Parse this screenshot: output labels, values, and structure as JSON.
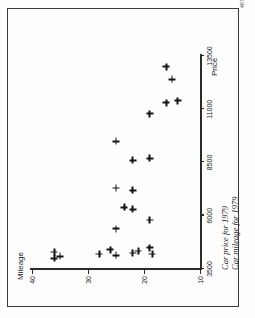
{
  "page": {
    "folio": "467",
    "background_color": "#fdfdfd",
    "ink_color": "#141414"
  },
  "caption": "Car price for 1979\nCar mileage for 1979",
  "chart_data": {
    "type": "scatter",
    "title": "",
    "xlabel": "Price",
    "ylabel": "Mileage",
    "xlim": [
      3500,
      13500
    ],
    "ylim": [
      10,
      40
    ],
    "xticks": [
      3500,
      6000,
      8500,
      11000,
      13500
    ],
    "xtick_labels": [
      "3500",
      "6000",
      "8500",
      "11000",
      "13500"
    ],
    "yticks": [
      10,
      20,
      30,
      40
    ],
    "ytick_labels": [
      "10",
      "20",
      "30",
      "40"
    ],
    "grid": false,
    "legend": "none",
    "marker": "plus",
    "points": [
      {
        "x": 4000,
        "y": 36
      },
      {
        "x": 4300,
        "y": 36
      },
      {
        "x": 4100,
        "y": 35
      },
      {
        "x": 4200,
        "y": 28
      },
      {
        "x": 4150,
        "y": 25
      },
      {
        "x": 4400,
        "y": 26
      },
      {
        "x": 5400,
        "y": 25
      },
      {
        "x": 4250,
        "y": 22
      },
      {
        "x": 4350,
        "y": 21
      },
      {
        "x": 4500,
        "y": 19
      },
      {
        "x": 4200,
        "y": 18.5
      },
      {
        "x": 5800,
        "y": 19
      },
      {
        "x": 6300,
        "y": 22
      },
      {
        "x": 6400,
        "y": 23.5
      },
      {
        "x": 7200,
        "y": 22
      },
      {
        "x": 7300,
        "y": 25
      },
      {
        "x": 8600,
        "y": 22
      },
      {
        "x": 8700,
        "y": 19
      },
      {
        "x": 9500,
        "y": 25
      },
      {
        "x": 10800,
        "y": 19
      },
      {
        "x": 11300,
        "y": 16
      },
      {
        "x": 11400,
        "y": 14
      },
      {
        "x": 12400,
        "y": 15
      },
      {
        "x": 13000,
        "y": 16
      }
    ]
  }
}
